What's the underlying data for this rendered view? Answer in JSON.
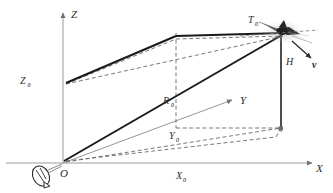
{
  "figure": {
    "type": "diagram",
    "background_color": "#ffffff",
    "width": 333,
    "height": 193
  },
  "axes": {
    "x": {
      "label": "X",
      "label_x": 316,
      "label_y": 170,
      "color": "#8a8a8a"
    },
    "y": {
      "label": "Y",
      "label_x": 240,
      "label_y": 101,
      "color": "#8a8a8a"
    },
    "z": {
      "label": "Z",
      "label_x": 71,
      "label_y": 14,
      "color": "#8a8a8a"
    }
  },
  "points": {
    "origin": {
      "label": "O",
      "x": 63,
      "y": 172
    },
    "target": {
      "label": "T",
      "sub": "0",
      "label_x": 251,
      "label_y": 22
    }
  },
  "segments": {
    "range": {
      "label": "R",
      "sub": "0",
      "label_x": 166,
      "label_y": 102,
      "color": "#1a1a1a"
    },
    "altitude": {
      "label": "H",
      "label_x": 286,
      "label_y": 62,
      "color": "#1a1a1a"
    },
    "z_offset": {
      "label": "Z",
      "sub": "0",
      "label_x": 23,
      "label_y": 78,
      "color": "#2b2b2b"
    },
    "y_offset": {
      "label": "Y",
      "sub": "0",
      "label_x": 172,
      "label_y": 137,
      "color": "#2b2b2b"
    },
    "x_offset": {
      "label": "X",
      "sub": "0",
      "label_x": 180,
      "label_y": 177,
      "color": "#2b2b2b"
    }
  },
  "vectors": {
    "velocity": {
      "label": "v",
      "label_x": 313,
      "label_y": 66,
      "color": "#2b2b2b"
    }
  },
  "icons": {
    "radar": {
      "name": "radar-antenna-icon",
      "x": 42,
      "y": 177
    },
    "aircraft": {
      "name": "aircraft-icon",
      "x": 283,
      "y": 33
    }
  },
  "colors": {
    "solid_line": "#1a1a1a",
    "dashed_line": "#555555",
    "axis": "#8a8a8a",
    "text": "#2b2b2b"
  }
}
